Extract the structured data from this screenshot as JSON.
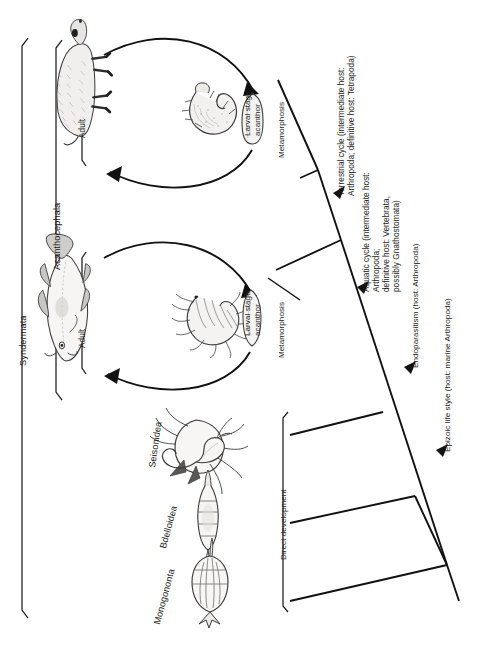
{
  "figure": {
    "type": "cladogram",
    "orientation": "rotated-90-counterclockwise",
    "background": "#ffffff",
    "line_color": "#111111"
  },
  "brackets": [
    {
      "id": "syndermata",
      "label": "Syndermata"
    },
    {
      "id": "acanthocephala",
      "label": "Acanthocephala"
    },
    {
      "id": "direct_dev",
      "label": "Direct development"
    }
  ],
  "terminals": [
    {
      "id": "terrestrial",
      "group": "Acanthocephala",
      "adult_label": "Adult",
      "larval_label": "Larval stage:\nacanthor",
      "metamorphosis_label": "Metamorphosis",
      "host_illustration": "wild-boar",
      "intermediate_illustration": "beetle-grub"
    },
    {
      "id": "aquatic",
      "group": "Acanthocephala",
      "adult_label": "Adult",
      "larval_label": "Larval stage:\nacanthor",
      "metamorphosis_label": "Metamorphosis",
      "host_illustration": "fish",
      "intermediate_illustration": "amphipod"
    },
    {
      "id": "seisonidea",
      "label": "Seisonidea",
      "illustration": "seison-on-nebalia"
    },
    {
      "id": "bdelloidea",
      "label": "Bdelloidea",
      "illustration": "bdelloid-rotifer"
    },
    {
      "id": "monogononta",
      "label": "Monogononta",
      "illustration": "monogonont-rotifer"
    }
  ],
  "branch_annotations": [
    {
      "id": "terrestrial_cycle",
      "text": "Terrestrial cycle (intermediate host:\nArthropoda; definitive host: Tetrapoda)"
    },
    {
      "id": "aquatic_cycle",
      "text": "Aquatic cycle (intermediate host: Arthropoda;\ndefinitive host: Vertebrata, possibly Gnathostomata)"
    },
    {
      "id": "endoparasitism",
      "text": "Endoparasitism (host: Arthropoda)"
    },
    {
      "id": "epizoic",
      "text": "Epizoic life style (host: marine Arthropoda)"
    }
  ]
}
